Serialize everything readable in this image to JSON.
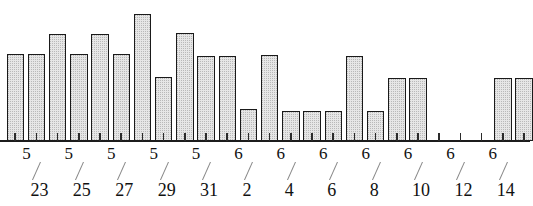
{
  "chart_data": {
    "type": "bar",
    "title": "",
    "subtitle": "",
    "xlabel": "",
    "ylabel": "",
    "grid": false,
    "legend": false,
    "axis": {
      "baseline_visible": true,
      "y_axis_visible": false,
      "x_tick_label_interval": 2
    },
    "ylim": [
      0,
      130
    ],
    "categories": [
      "5/22",
      "5/23",
      "5/24",
      "5/25",
      "5/26",
      "5/27",
      "5/28",
      "5/29",
      "5/30",
      "5/31",
      "6/1",
      "6/2",
      "6/3",
      "6/4",
      "6/5",
      "6/6",
      "6/7",
      "6/8",
      "6/9",
      "6/10",
      "6/11",
      "6/12",
      "6/13",
      "6/14",
      "6/15"
    ],
    "values": [
      88,
      88,
      108,
      88,
      108,
      88,
      128,
      65,
      109,
      86,
      86,
      32,
      87,
      30,
      30,
      30,
      86,
      30,
      64,
      64,
      0,
      0,
      0,
      64,
      64
    ],
    "tick_labels": [
      {
        "month": "5",
        "day": "23",
        "category": "5/23"
      },
      {
        "month": "5",
        "day": "25",
        "category": "5/25"
      },
      {
        "month": "5",
        "day": "27",
        "category": "5/27"
      },
      {
        "month": "5",
        "day": "29",
        "category": "5/29"
      },
      {
        "month": "5",
        "day": "31",
        "category": "5/31"
      },
      {
        "month": "6",
        "day": "2",
        "category": "6/2"
      },
      {
        "month": "6",
        "day": "4",
        "category": "6/4"
      },
      {
        "month": "6",
        "day": "6",
        "category": "6/6"
      },
      {
        "month": "6",
        "day": "8",
        "category": "6/8"
      },
      {
        "month": "6",
        "day": "10",
        "category": "6/10"
      },
      {
        "month": "6",
        "day": "12",
        "category": "6/12"
      },
      {
        "month": "6",
        "day": "14",
        "category": "6/14"
      }
    ],
    "colors": {
      "bar_fill": "#e6e6e6",
      "bar_pattern": "#b9b9b9",
      "bar_border": "#1a1a1a",
      "axis": "#1c1c1c",
      "tick": "#2b2b2b",
      "label_text": "#111111",
      "slash": "#8a8a8a",
      "background": "#ffffff"
    }
  }
}
